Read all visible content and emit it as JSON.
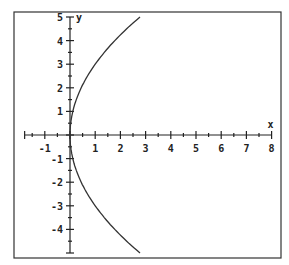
{
  "chart_data": {
    "type": "line",
    "title": "",
    "xlabel": "x",
    "ylabel": "y",
    "xlim": [
      -1.8,
      8
    ],
    "ylim": [
      -5,
      5
    ],
    "grid": false,
    "x_ticks": [
      "-1",
      "1",
      "2",
      "3",
      "4",
      "5",
      "6",
      "7",
      "8"
    ],
    "y_ticks": [
      "5",
      "4",
      "3",
      "2",
      "1",
      "-1",
      "-2",
      "-3",
      "-4"
    ],
    "series": [
      {
        "name": "y^2 = 9x",
        "x": [
          2.78,
          1.78,
          1.0,
          0.44,
          0.11,
          0.0,
          0.11,
          0.44,
          1.0,
          1.78,
          2.78
        ],
        "y": [
          5,
          4,
          3,
          2,
          1,
          0,
          -1,
          -2,
          -3,
          -4,
          -5
        ]
      }
    ]
  },
  "labels": {
    "x_axis": "x",
    "y_axis": "y",
    "xt": [
      "-1",
      "1",
      "2",
      "3",
      "4",
      "5",
      "6",
      "7",
      "8"
    ],
    "yt": [
      "5",
      "4",
      "3",
      "2",
      "1",
      "-1",
      "-2",
      "-3",
      "-4"
    ]
  }
}
